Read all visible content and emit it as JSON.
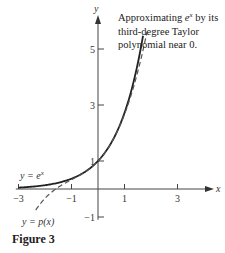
{
  "chart_data": {
    "type": "line",
    "title": "",
    "annotation": [
      "Approximating e^x by its",
      "third-degree Taylor",
      "polynomial near 0."
    ],
    "xlabel": "x",
    "ylabel": "y",
    "xlim": [
      -3.1,
      4.5
    ],
    "ylim": [
      -1.1,
      5.6
    ],
    "x_ticks": [
      -3,
      -1,
      1,
      3
    ],
    "x_tick_labels": [
      "−3",
      "−1",
      "1",
      "3"
    ],
    "y_ticks": [
      -1,
      1,
      3,
      5
    ],
    "y_tick_labels": [
      "−1",
      "1",
      "3",
      "5"
    ],
    "grid": false,
    "series": [
      {
        "name": "y = e^x",
        "function": "exp(x)",
        "domain": [
          -3,
          1.7
        ],
        "style": "solid",
        "label": "y = e",
        "label_sup": "x"
      },
      {
        "name": "y = p(x)",
        "function": "1 + x + x^2/2 + x^3/6",
        "domain": [
          -2.35,
          1.85
        ],
        "style": "dashed",
        "label": "y = p(x)"
      }
    ]
  },
  "caption": "Figure 3"
}
